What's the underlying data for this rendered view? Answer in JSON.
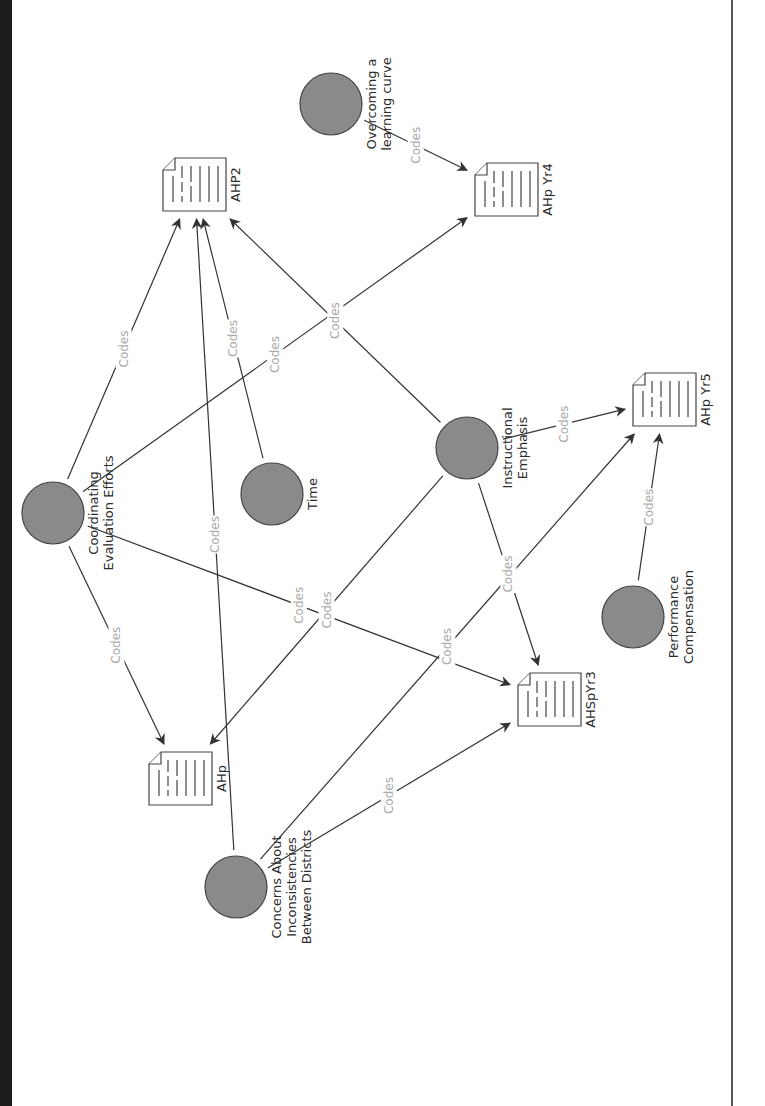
{
  "diagram": {
    "title": "",
    "rotation_deg": -90,
    "colors": {
      "node_fill": "#8a8a8a",
      "node_stroke": "#444444",
      "edge": "#333333",
      "edge_label": "#a8a8a8",
      "node_label": "#2a2a2a",
      "left_strip": "#1c1c1c",
      "right_rule": "#555555"
    },
    "codes": [
      {
        "id": "overcoming",
        "lines": [
          "Overcoming a",
          "learning curve"
        ],
        "cx": 331,
        "cy": 104
      },
      {
        "id": "coordinating",
        "lines": [
          "Coordinating",
          "Evaluation Efforts"
        ],
        "cx": 53,
        "cy": 513
      },
      {
        "id": "time",
        "lines": [
          "Time"
        ],
        "cx": 272,
        "cy": 494
      },
      {
        "id": "instructional",
        "lines": [
          "Instructional",
          "Emphasis"
        ],
        "cx": 467,
        "cy": 448
      },
      {
        "id": "performance",
        "lines": [
          "Performance",
          "Compensation"
        ],
        "cx": 633,
        "cy": 617
      },
      {
        "id": "concerns",
        "lines": [
          "Concerns About",
          "Inconsistencies",
          "Between Districts"
        ],
        "cx": 236,
        "cy": 887
      }
    ],
    "documents": [
      {
        "id": "ahp2",
        "label": "AHP2",
        "x": 163,
        "y": 158
      },
      {
        "id": "ahpyr4",
        "label": "AHp Yr4",
        "x": 475,
        "y": 163
      },
      {
        "id": "ahpyr5",
        "label": "AHp Yr5",
        "x": 633,
        "y": 373
      },
      {
        "id": "ahspyr3",
        "label": "AHSpYr3",
        "x": 518,
        "y": 673
      },
      {
        "id": "ahp",
        "label": "AHp",
        "x": 149,
        "y": 752
      }
    ],
    "edge_label": "Codes",
    "edges": [
      {
        "from": "overcoming",
        "to": "ahpyr4",
        "label": "Codes"
      },
      {
        "from": "coordinating",
        "to": "ahp2",
        "label": "Codes"
      },
      {
        "from": "coordinating",
        "to": "ahpyr4",
        "label": "Codes"
      },
      {
        "from": "coordinating",
        "to": "ahp",
        "label": "Codes"
      },
      {
        "from": "coordinating",
        "to": "ahspyr3",
        "label": "Codes"
      },
      {
        "from": "time",
        "to": "ahp2",
        "label": "Codes"
      },
      {
        "from": "instructional",
        "to": "ahp2",
        "label": "Codes"
      },
      {
        "from": "instructional",
        "to": "ahpyr5",
        "label": "Codes"
      },
      {
        "from": "instructional",
        "to": "ahspyr3",
        "label": "Codes"
      },
      {
        "from": "instructional",
        "to": "ahp",
        "label": "Codes"
      },
      {
        "from": "performance",
        "to": "ahpyr5",
        "label": "Codes"
      },
      {
        "from": "concerns",
        "to": "ahp2",
        "label": "Codes"
      },
      {
        "from": "concerns",
        "to": "ahspyr3",
        "label": "Codes"
      },
      {
        "from": "concerns",
        "to": "ahpyr5",
        "label": "Codes"
      }
    ]
  }
}
